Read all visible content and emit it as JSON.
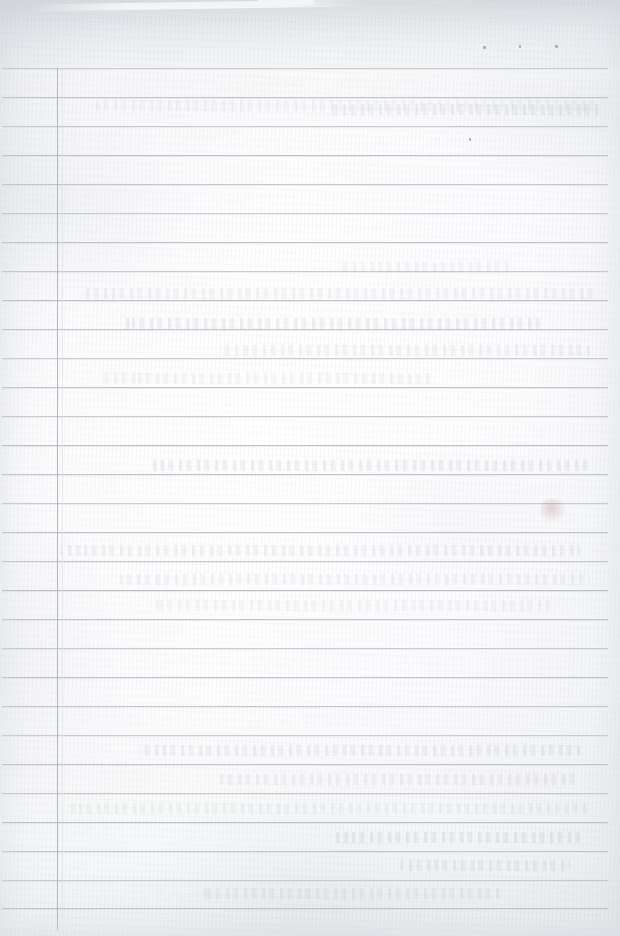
{
  "document": {
    "kind": "scanned-ruled-page",
    "title": "Blank Ruled Ledger Page",
    "content_text": "",
    "page_width": 620,
    "page_height": 936,
    "background_color": "#fbfbfc",
    "rule_color": "#b9bdc2",
    "margin_rule_color": "#b0b5bb"
  },
  "header_band": {
    "label": "Header Band",
    "top": 0,
    "height": 68,
    "text": "",
    "notch": {
      "label": "Top Edge Notch",
      "x": 258,
      "y": 0,
      "width": 56,
      "height": 5
    },
    "streak": {
      "label": "Scan Light Streak",
      "x": 30,
      "y": 2,
      "width": 330,
      "height": 7
    }
  },
  "ruling": {
    "label": "Ruled Lines",
    "horizontal_count": 30,
    "horizontal_spacing": 29,
    "horizontal_start_y": 68,
    "horizontal_left_x": 2,
    "horizontal_width": 606,
    "horizontal_y_positions": [
      68,
      97,
      126,
      155,
      184,
      213,
      242,
      271,
      300,
      329,
      358,
      387,
      416,
      445,
      474,
      503,
      532,
      561,
      590,
      619,
      648,
      677,
      706,
      735,
      764,
      793,
      822,
      851,
      880,
      908
    ],
    "vertical_margin_x": 57,
    "vertical_margin_top": 68,
    "vertical_margin_height": 862,
    "vertical_secondary_x": 62
  },
  "marks": {
    "label": "Ink Specks",
    "specks": [
      {
        "name": "speck-1",
        "x": 483,
        "y": 46,
        "w": 3,
        "h": 3
      },
      {
        "name": "speck-2",
        "x": 519,
        "y": 45,
        "w": 2,
        "h": 3
      },
      {
        "name": "speck-3",
        "x": 555,
        "y": 45,
        "w": 3,
        "h": 3
      },
      {
        "name": "speck-4",
        "x": 469,
        "y": 138,
        "w": 2,
        "h": 3
      }
    ],
    "smudges": [
      {
        "name": "smudge-right-mid",
        "x": 540,
        "y": 498,
        "w": 26,
        "h": 24
      }
    ]
  },
  "bleed_through": {
    "label": "Faint Bleed-Through Writing",
    "legible": false,
    "transcription": "",
    "lines": [
      {
        "x": 96,
        "y": 100,
        "width": 500
      },
      {
        "x": 330,
        "y": 104,
        "width": 270
      },
      {
        "x": 86,
        "y": 288,
        "width": 512
      },
      {
        "x": 340,
        "y": 262,
        "width": 170
      },
      {
        "x": 120,
        "y": 318,
        "width": 420
      },
      {
        "x": 220,
        "y": 345,
        "width": 370
      },
      {
        "x": 100,
        "y": 373,
        "width": 330
      },
      {
        "x": 150,
        "y": 460,
        "width": 440
      },
      {
        "x": 60,
        "y": 545,
        "width": 520
      },
      {
        "x": 120,
        "y": 574,
        "width": 470
      },
      {
        "x": 150,
        "y": 600,
        "width": 400
      },
      {
        "x": 140,
        "y": 745,
        "width": 440
      },
      {
        "x": 220,
        "y": 774,
        "width": 360
      },
      {
        "x": 70,
        "y": 803,
        "width": 520
      },
      {
        "x": 330,
        "y": 832,
        "width": 250
      },
      {
        "x": 400,
        "y": 860,
        "width": 170
      },
      {
        "x": 200,
        "y": 888,
        "width": 300
      }
    ]
  }
}
